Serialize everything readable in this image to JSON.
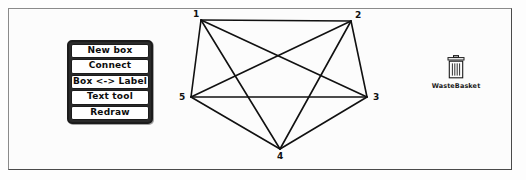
{
  "window": {
    "background_color": "#fcfcfc",
    "border_color": "#8a8a8a"
  },
  "tool_menu": {
    "buttons": [
      {
        "label": "New box",
        "name": "new-box-button"
      },
      {
        "label": "Connect",
        "name": "connect-button"
      },
      {
        "label": "Box <-> Label",
        "name": "box-label-toggle-button"
      },
      {
        "label": "Text tool",
        "name": "text-tool-button"
      },
      {
        "label": "Redraw",
        "name": "redraw-button"
      }
    ]
  },
  "wastebasket": {
    "label": "WasteBasket",
    "icon": "trash-can-icon"
  },
  "graph": {
    "stroke_color": "#111111",
    "nodes": [
      {
        "id": "1",
        "label": "1",
        "x": 201,
        "y": 20,
        "label_x": 193,
        "label_y": 10
      },
      {
        "id": "2",
        "label": "2",
        "x": 351,
        "y": 21,
        "label_x": 355,
        "label_y": 11
      },
      {
        "id": "3",
        "label": "3",
        "x": 367,
        "y": 97,
        "label_x": 373,
        "label_y": 93
      },
      {
        "id": "4",
        "label": "4",
        "x": 280,
        "y": 149,
        "label_x": 277,
        "label_y": 152
      },
      {
        "id": "5",
        "label": "5",
        "x": 191,
        "y": 97,
        "label_x": 179,
        "label_y": 93
      }
    ],
    "edges": [
      {
        "from": "1",
        "to": "2"
      },
      {
        "from": "1",
        "to": "3"
      },
      {
        "from": "1",
        "to": "4"
      },
      {
        "from": "1",
        "to": "5"
      },
      {
        "from": "2",
        "to": "3"
      },
      {
        "from": "2",
        "to": "4"
      },
      {
        "from": "2",
        "to": "5"
      },
      {
        "from": "3",
        "to": "4"
      },
      {
        "from": "3",
        "to": "5"
      },
      {
        "from": "4",
        "to": "5"
      }
    ]
  }
}
